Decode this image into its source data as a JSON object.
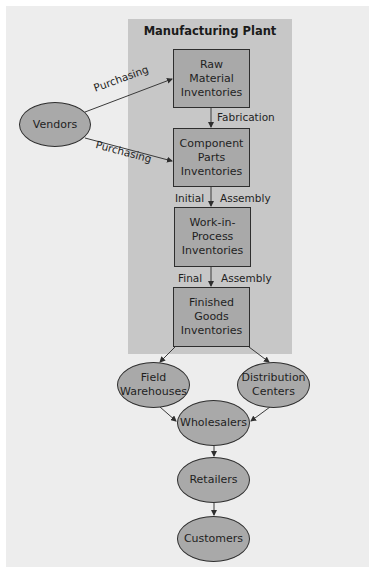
{
  "diagram": {
    "plant_title": "Manufacturing Plant",
    "nodes": {
      "vendors": "Vendors",
      "raw": "Raw Material Inventories",
      "component": "Component Parts Inventories",
      "wip": "Work-in-Process Inventories",
      "finished": "Finished Goods Inventories",
      "field": "Field Warehouses",
      "distribution": "Distribution Centers",
      "wholesalers": "Wholesalers",
      "retailers": "Retailers",
      "customers": "Customers"
    },
    "node_lines": {
      "raw": [
        "Raw",
        "Material",
        "Inventories"
      ],
      "component": [
        "Component",
        "Parts",
        "Inventories"
      ],
      "wip": [
        "Work-in-",
        "Process",
        "Inventories"
      ],
      "finished": [
        "Finished",
        "Goods",
        "Inventories"
      ],
      "field": [
        "Field",
        "Warehouses"
      ],
      "distribution": [
        "Distribution",
        "Centers"
      ]
    },
    "edge_labels": {
      "purchasing_top": "Purchasing",
      "purchasing_bottom": "Purchasing",
      "fabrication": "Fabrication",
      "initial": "Initial",
      "assembly_1": "Assembly",
      "final": "Final",
      "assembly_2": "Assembly"
    },
    "colors": {
      "panel": "#ededed",
      "plant": "#c7c7c7",
      "node_fill": "#a9a9a9",
      "border": "#2e2e2e"
    }
  }
}
